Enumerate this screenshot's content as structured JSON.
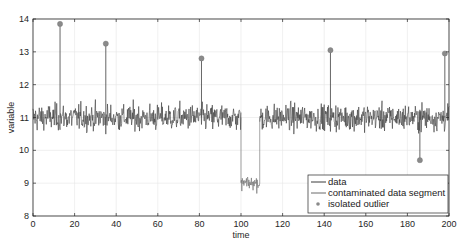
{
  "chart_data": {
    "type": "line",
    "title": "",
    "xlabel": "time",
    "ylabel": "variable",
    "xlim": [
      0,
      200
    ],
    "ylim": [
      8,
      14
    ],
    "xticks": [
      0,
      20,
      40,
      60,
      80,
      100,
      120,
      140,
      160,
      180,
      200
    ],
    "yticks": [
      8,
      9,
      10,
      11,
      12,
      13,
      14
    ],
    "grid": true,
    "legend_position": "lower right",
    "series": [
      {
        "name": "data",
        "type": "line",
        "color": "#3a3a3a",
        "description": "noisy signal around ~11 (range approx 10.2-11.9) for t in [0,100] and [109,200]",
        "baseline": 11.0,
        "noise_range": [
          10.2,
          11.9
        ],
        "segments": [
          [
            0,
            100
          ],
          [
            109,
            200
          ]
        ]
      },
      {
        "name": "contaminated data segment",
        "type": "line",
        "color": "#6a6a6a",
        "description": "shifted segment around ~9 between t=100 and t=109",
        "baseline": 9.0,
        "noise_range": [
          8.7,
          9.3
        ],
        "segments": [
          [
            100,
            109
          ]
        ]
      },
      {
        "name": "isolated outlier",
        "type": "scatter",
        "color": "#8a8a8a",
        "points": [
          {
            "x": 13,
            "y": 13.85
          },
          {
            "x": 35,
            "y": 13.25
          },
          {
            "x": 81,
            "y": 12.8
          },
          {
            "x": 143,
            "y": 13.05
          },
          {
            "x": 186,
            "y": 9.7
          },
          {
            "x": 198,
            "y": 12.95
          }
        ]
      }
    ]
  },
  "legend": {
    "items": [
      {
        "label": "data"
      },
      {
        "label": "contaminated data segment"
      },
      {
        "label": "isolated outlier"
      }
    ]
  },
  "axes": {
    "xlabel": "time",
    "ylabel": "variable"
  }
}
